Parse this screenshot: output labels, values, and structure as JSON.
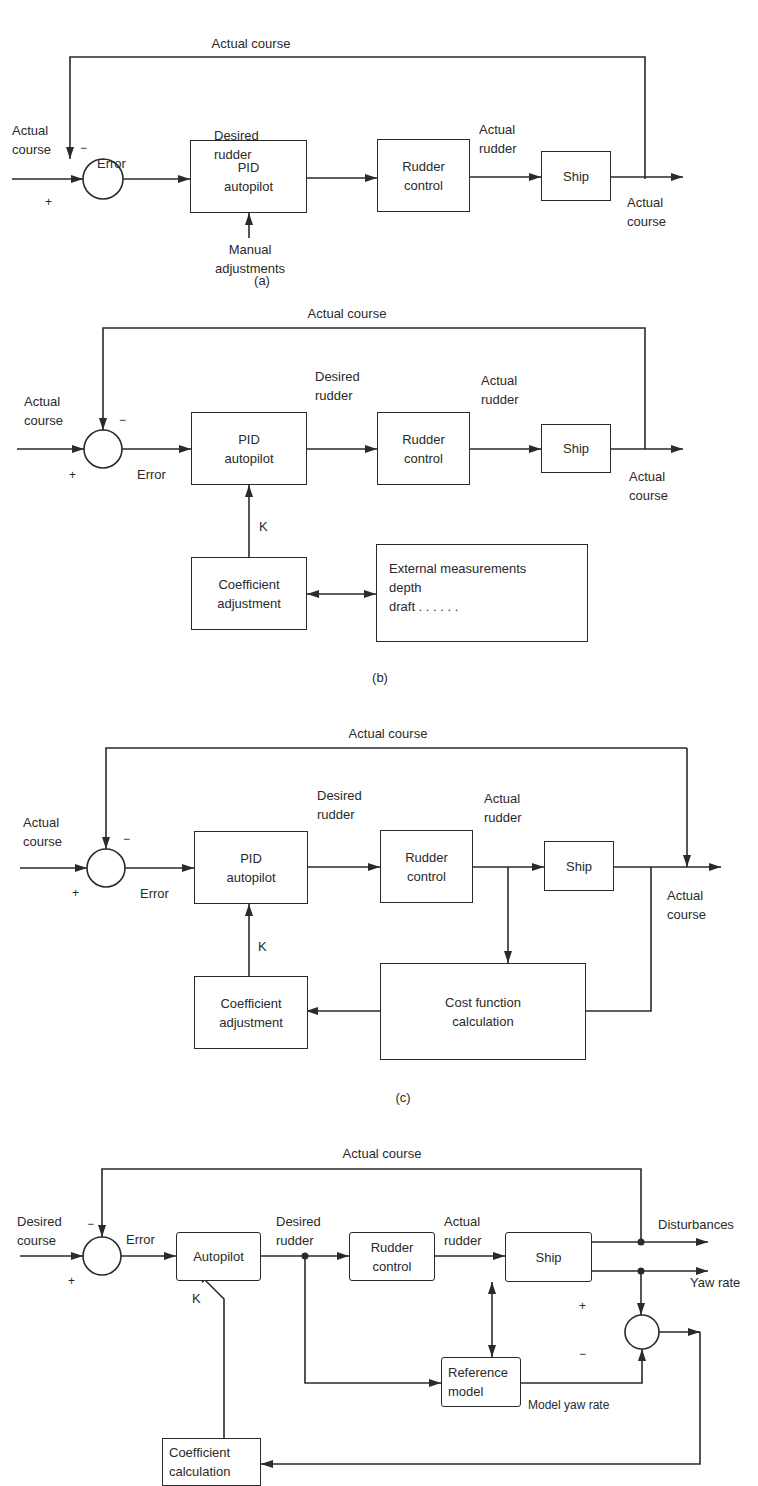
{
  "panels": {
    "a": {
      "caption": "(a)",
      "feedback_label": "Actual course",
      "input_label": "Actual\ncourse",
      "minus": "−",
      "plus": "+",
      "error_label": "Error",
      "pid_box": "PID\nautopilot",
      "desired_rudder_label": "Desired\nrudder",
      "rudder_control_box": "Rudder\ncontrol",
      "actual_rudder_label": "Actual\nrudder",
      "ship_box": "Ship",
      "output_label": "Actual\ncourse",
      "manual_label": "Manual\nadjustments"
    },
    "b": {
      "caption": "(b)",
      "feedback_label": "Actual course",
      "input_label": "Actual\ncourse",
      "minus": "−",
      "plus": "+",
      "error_label": "Error",
      "pid_box": "PID\nautopilot",
      "desired_rudder_label": "Desired\nrudder",
      "rudder_control_box": "Rudder\ncontrol",
      "actual_rudder_label": "Actual\nrudder",
      "ship_box": "Ship",
      "output_label": "Actual\ncourse",
      "k_label": "K",
      "coeff_box": "Coefficient\nadjustment",
      "external_box": "External measurements\ndepth\ndraft . . . . . ."
    },
    "c": {
      "caption": "(c)",
      "feedback_label": "Actual course",
      "input_label": "Actual\ncourse",
      "minus": "−",
      "plus": "+",
      "error_label": "Error",
      "pid_box": "PID\nautopilot",
      "desired_rudder_label": "Desired\nrudder",
      "rudder_control_box": "Rudder\ncontrol",
      "actual_rudder_label": "Actual\nrudder",
      "ship_box": "Ship",
      "output_label": "Actual\ncourse",
      "k_label": "K",
      "coeff_box": "Coefficient\nadjustment",
      "cost_box": "Cost function\ncalculation"
    },
    "d": {
      "feedback_label": "Actual course",
      "input_label": "Desired\ncourse",
      "minus": "−",
      "plus": "+",
      "error_label": "Error",
      "autopilot_box": "Autopilot",
      "desired_rudder_label": "Desired\nrudder",
      "rudder_control_box": "Rudder\ncontrol",
      "actual_rudder_label": "Actual\nrudder",
      "ship_box": "Ship",
      "disturbances_label": "Disturbances",
      "yaw_rate_label": "Yaw rate",
      "k_label": "K",
      "reference_model_box": "Reference\nmodel",
      "model_yaw_rate_label": "Model yaw rate",
      "sum2_plus": "+",
      "sum2_minus": "−",
      "coeff_calc_box": "Coefficient\ncalculation"
    }
  },
  "colors": {
    "ink": "#2a2a2a",
    "background": "#ffffff"
  }
}
